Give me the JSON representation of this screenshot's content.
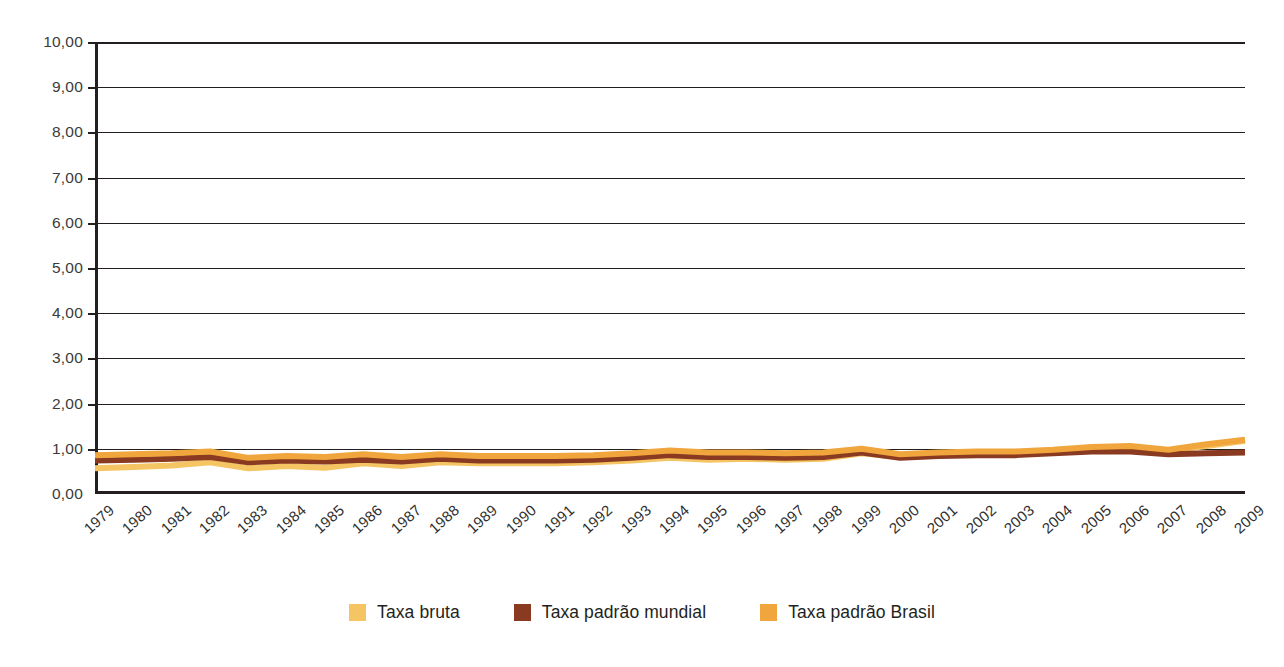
{
  "chart_data": {
    "type": "line",
    "title": "",
    "subtitle": "",
    "xlabel": "",
    "ylabel": "",
    "xlim": [
      1979,
      2009
    ],
    "ylim": [
      0,
      10
    ],
    "grid": true,
    "legend_position": "bottom",
    "y_tick_labels": [
      "10,00",
      "9,00",
      "8,00",
      "7,00",
      "6,00",
      "5,00",
      "4,00",
      "3,00",
      "2,00",
      "1,00",
      "0,00"
    ],
    "y_tick_values": [
      10,
      9,
      8,
      7,
      6,
      5,
      4,
      3,
      2,
      1,
      0
    ],
    "categories": [
      "1979",
      "1980",
      "1981",
      "1982",
      "1983",
      "1984",
      "1985",
      "1986",
      "1987",
      "1988",
      "1989",
      "1990",
      "1991",
      "1992",
      "1993",
      "1994",
      "1995",
      "1996",
      "1997",
      "1998",
      "1999",
      "2000",
      "2001",
      "2002",
      "2003",
      "2004",
      "2005",
      "2006",
      "2007",
      "2008",
      "2009"
    ],
    "series": [
      {
        "name": "Taxa bruta",
        "color": "#F5C463",
        "values": [
          0.57,
          0.6,
          0.63,
          0.7,
          0.57,
          0.62,
          0.58,
          0.68,
          0.62,
          0.7,
          0.68,
          0.68,
          0.68,
          0.7,
          0.74,
          0.8,
          0.76,
          0.78,
          0.76,
          0.78,
          0.9,
          0.82,
          0.86,
          0.88,
          0.9,
          0.96,
          1.0,
          1.02,
          0.96,
          1.06,
          1.18
        ]
      },
      {
        "name": "Taxa padrão mundial",
        "color": "#8A3A20",
        "values": [
          0.74,
          0.76,
          0.78,
          0.82,
          0.7,
          0.74,
          0.72,
          0.76,
          0.72,
          0.78,
          0.74,
          0.74,
          0.74,
          0.76,
          0.8,
          0.86,
          0.82,
          0.82,
          0.8,
          0.82,
          0.92,
          0.8,
          0.84,
          0.86,
          0.86,
          0.9,
          0.94,
          0.94,
          0.88,
          0.9,
          0.92
        ]
      },
      {
        "name": "Taxa padrão Brasil",
        "color": "#F0A63C",
        "values": [
          0.86,
          0.88,
          0.9,
          0.94,
          0.8,
          0.84,
          0.82,
          0.88,
          0.82,
          0.88,
          0.84,
          0.84,
          0.84,
          0.86,
          0.9,
          0.96,
          0.92,
          0.92,
          0.9,
          0.92,
          1.0,
          0.88,
          0.92,
          0.94,
          0.94,
          0.98,
          1.04,
          1.06,
          0.98,
          1.1,
          1.2
        ]
      }
    ]
  },
  "legend": {
    "items": [
      {
        "label": "Taxa bruta",
        "color": "#F5C463"
      },
      {
        "label": "Taxa padrão mundial",
        "color": "#8A3A20"
      },
      {
        "label": "Taxa padrão Brasil",
        "color": "#F0A63C"
      }
    ]
  }
}
